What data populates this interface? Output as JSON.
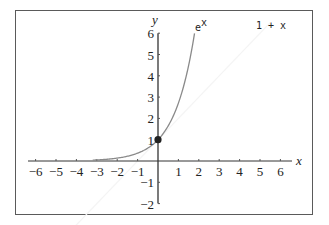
{
  "chart_data": {
    "type": "line",
    "title": "",
    "xlabel": "x",
    "ylabel": "y",
    "xlim": [
      -6.5,
      6.5
    ],
    "ylim": [
      -2,
      6
    ],
    "x_ticks": [
      "-6",
      "-5",
      "-4",
      "-3",
      "-2",
      "-1",
      "1",
      "2",
      "3",
      "4",
      "5",
      "6"
    ],
    "y_ticks": [
      "-2",
      "-1",
      "1",
      "2",
      "3",
      "4",
      "5",
      "6"
    ],
    "grid": false,
    "series": [
      {
        "name": "e^x",
        "label": "e",
        "label_sup": "x",
        "color": "#8a8a8a",
        "x_range": [
          -3.2,
          1.79
        ],
        "function": "exp(x)"
      },
      {
        "name": "1 + x",
        "label": "1 + x",
        "color": "#f4f4f4",
        "x_range": [
          -6.5,
          5.5
        ],
        "function": "1+x"
      }
    ],
    "points": [
      {
        "x": 0,
        "y": 1,
        "label": "",
        "color": "#222222"
      }
    ]
  }
}
